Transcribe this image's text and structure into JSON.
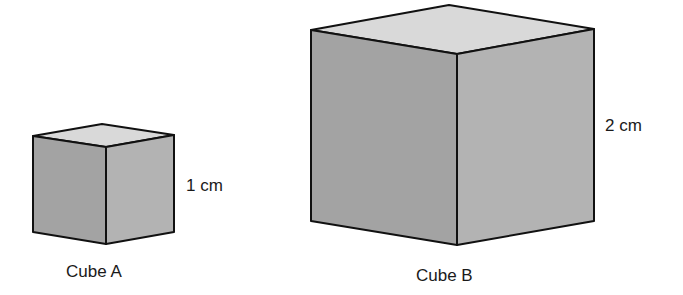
{
  "figure": {
    "cube_a": {
      "name_label": "Cube A",
      "dimension_label": "1 cm",
      "edge_length_cm": 1
    },
    "cube_b": {
      "name_label": "Cube B",
      "dimension_label": "2 cm",
      "edge_length_cm": 2
    }
  },
  "colors": {
    "top_face": "#d9d9d9",
    "left_face": "#a3a3a3",
    "right_face": "#b3b3b3",
    "edge": "#111111"
  }
}
